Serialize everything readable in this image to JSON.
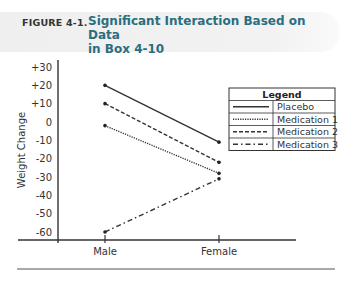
{
  "figure": {
    "label": "FIGURE 4-1.",
    "title": "Significant Interaction Based on Data in Box 4-10",
    "title_line1": "Significant Interaction Based on Data",
    "title_line2": "in Box 4-10",
    "accent_color": "#2a6e7f"
  },
  "chart_data": {
    "type": "line",
    "title": "Significant Interaction Based on Data in Box 4-10",
    "xlabel": "",
    "ylabel": "Weight Change",
    "categories": [
      "Male",
      "Female"
    ],
    "yticks": [
      "+30",
      "+20",
      "+10",
      "0",
      "-10",
      "-20",
      "-30",
      "-40",
      "-50",
      "-60"
    ],
    "ylim": [
      -65,
      33
    ],
    "grid": false,
    "legend_position": "upper right",
    "legend_title": "Legend",
    "series": [
      {
        "name": "Placebo",
        "values": [
          20,
          -11
        ],
        "style": "solid"
      },
      {
        "name": "Medication 1",
        "values": [
          -2,
          -28
        ],
        "style": "dotted"
      },
      {
        "name": "Medication 2",
        "values": [
          10,
          -22
        ],
        "style": "dashed"
      },
      {
        "name": "Medication 3",
        "values": [
          -60,
          -31
        ],
        "style": "dash-dot"
      }
    ]
  }
}
